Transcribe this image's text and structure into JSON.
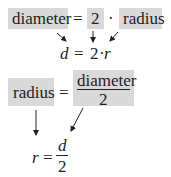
{
  "equation1": {
    "terms": [
      "diameter",
      "=",
      "2",
      "·",
      "radius"
    ],
    "symbolic": {
      "lhs": "d",
      "eq": "=",
      "coef": "2",
      "dot": "·",
      "var": "r"
    }
  },
  "equation2": {
    "lhs": "radius",
    "eq": "=",
    "numerator": "diameter",
    "denominator": "2",
    "symbolic": {
      "lhs": "r",
      "eq": "=",
      "numerator": "d",
      "denominator": "2"
    }
  },
  "colors": {
    "highlight": "#d9d9d9",
    "ink": "#222222"
  }
}
